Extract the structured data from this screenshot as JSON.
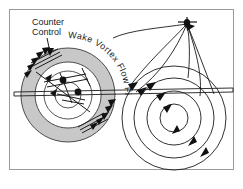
{
  "figure": {
    "name": "wake-vortex-flow-field-diagram",
    "background_color": "#ffffff",
    "border_color": "#9a9a9a",
    "line_color": "#1a1a1a",
    "annulus_fill_color": "#c8c8c8",
    "labels": {
      "counter_control_line1": "Counter",
      "counter_control_line2": "Control",
      "curved_caption": "Wake Vortex Flow Field"
    },
    "curved_caption_chars": [
      "W",
      "a",
      "k",
      "e",
      " ",
      "V",
      "o",
      "r",
      "t",
      "e",
      "x",
      " ",
      "F",
      "l",
      "o",
      "w",
      " ",
      "F",
      "i",
      "e",
      "l",
      "d"
    ],
    "left_assembly": {
      "name": "counter-control-ring",
      "center_x": 68,
      "center_y": 95,
      "outer_radius": 47,
      "inner_radius": 33,
      "mid_radius": 24,
      "core_radius": 13,
      "arrow_count_upper_left": 5,
      "arrow_count_lower_right": 5,
      "vortex_core_dots": [
        {
          "x": 63,
          "y": 80
        },
        {
          "x": 78,
          "y": 92
        }
      ]
    },
    "right_assembly": {
      "name": "wake-vortex-flow-field",
      "apex_x": 187,
      "apex_y": 24,
      "vortex_center_x": 174,
      "vortex_center_y": 118,
      "circle_radii": [
        14,
        27,
        40,
        52
      ],
      "streamline_arrow_count": 7
    },
    "ground_line": {
      "name": "ground-reference-line",
      "left_x": 14,
      "right_x": 233,
      "left_y": 92,
      "right_y": 88
    }
  }
}
